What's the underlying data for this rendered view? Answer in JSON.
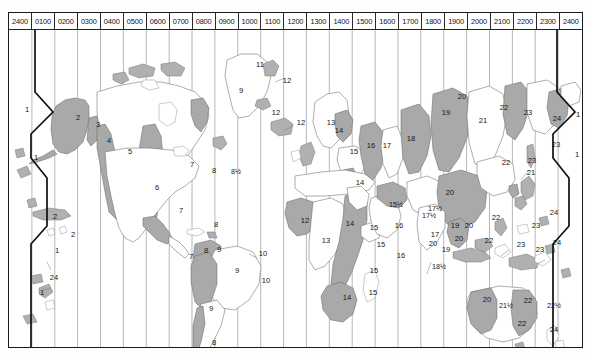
{
  "map": {
    "title": "World Standard Time Zone Chart",
    "hour_headers": [
      "2400",
      "0100",
      "0200",
      "0300",
      "0400",
      "0500",
      "0600",
      "0700",
      "0800",
      "0900",
      "1000",
      "1100",
      "1200",
      "1300",
      "1400",
      "1500",
      "1600",
      "1700",
      "1800",
      "1900",
      "2000",
      "2100",
      "2200",
      "2300",
      "2400"
    ],
    "colors": {
      "shaded_zone": "#a9a9a9",
      "unshaded_zone": "#ffffff",
      "coastline": "#6b6b6b",
      "meridian": "#9a9a9a",
      "dateline": "#101010",
      "frame": "#1a1a1a"
    },
    "zone_labels": [
      {
        "text": "1",
        "x": 18,
        "y": 97,
        "region": "bering-west"
      },
      {
        "text": "1",
        "x": 27,
        "y": 145,
        "region": "aleutians"
      },
      {
        "text": "2",
        "x": 69,
        "y": 105,
        "region": "alaska"
      },
      {
        "text": "3",
        "x": 89,
        "y": 112,
        "region": "yukon-coast"
      },
      {
        "text": "4",
        "x": 100,
        "y": 128,
        "region": "pacific-nw"
      },
      {
        "text": "5",
        "x": 121,
        "y": 139,
        "region": "canada-prairie"
      },
      {
        "text": "6",
        "x": 148,
        "y": 175,
        "region": "central-us-mexico"
      },
      {
        "text": "7",
        "x": 183,
        "y": 152,
        "region": "eastern-us"
      },
      {
        "text": "8",
        "x": 205,
        "y": 158,
        "region": "maritime-canada"
      },
      {
        "text": "8½",
        "x": 227,
        "y": 159,
        "region": "newfoundland"
      },
      {
        "text": "9",
        "x": 232,
        "y": 78,
        "region": "north-atlantic"
      },
      {
        "text": "11",
        "x": 251,
        "y": 52,
        "region": "greenland-west"
      },
      {
        "text": "12",
        "x": 278,
        "y": 68,
        "region": "greenland-east"
      },
      {
        "text": "12",
        "x": 267,
        "y": 100,
        "region": "iceland"
      },
      {
        "text": "12",
        "x": 292,
        "y": 110,
        "region": "faroe"
      },
      {
        "text": "13",
        "x": 322,
        "y": 110,
        "region": "scandinavia-west"
      },
      {
        "text": "14",
        "x": 330,
        "y": 118,
        "region": "finland"
      },
      {
        "text": "15",
        "x": 345,
        "y": 139,
        "region": "baltic"
      },
      {
        "text": "16",
        "x": 362,
        "y": 133,
        "region": "moscow"
      },
      {
        "text": "17",
        "x": 378,
        "y": 133,
        "region": "volga"
      },
      {
        "text": "18",
        "x": 402,
        "y": 126,
        "region": "urals"
      },
      {
        "text": "19",
        "x": 437,
        "y": 100,
        "region": "west-siberia"
      },
      {
        "text": "20",
        "x": 453,
        "y": 84,
        "region": "krasnoyarsk"
      },
      {
        "text": "21",
        "x": 474,
        "y": 108,
        "region": "irkutsk"
      },
      {
        "text": "22",
        "x": 495,
        "y": 95,
        "region": "yakutsk"
      },
      {
        "text": "23",
        "x": 519,
        "y": 100,
        "region": "magadan"
      },
      {
        "text": "24",
        "x": 548,
        "y": 106,
        "region": "kamchatka"
      },
      {
        "text": "1",
        "x": 569,
        "y": 102,
        "region": "dateline-east-top"
      },
      {
        "text": "1",
        "x": 568,
        "y": 142,
        "region": "dateline-east-low"
      },
      {
        "text": "22",
        "x": 497,
        "y": 150,
        "region": "amur"
      },
      {
        "text": "23",
        "x": 523,
        "y": 148,
        "region": "sakhalin"
      },
      {
        "text": "21",
        "x": 522,
        "y": 160,
        "region": "khabarovsk"
      },
      {
        "text": "23",
        "x": 547,
        "y": 132,
        "region": "kuril"
      },
      {
        "text": "20",
        "x": 441,
        "y": 180,
        "region": "china-north"
      },
      {
        "text": "12",
        "x": 296,
        "y": 208,
        "region": "west-africa"
      },
      {
        "text": "13",
        "x": 317,
        "y": 228,
        "region": "central-africa"
      },
      {
        "text": "14",
        "x": 341,
        "y": 211,
        "region": "east-africa"
      },
      {
        "text": "14",
        "x": 338,
        "y": 285,
        "region": "south-africa"
      },
      {
        "text": "14",
        "x": 351,
        "y": 170,
        "region": "egypt"
      },
      {
        "text": "15",
        "x": 365,
        "y": 215,
        "region": "horn"
      },
      {
        "text": "15",
        "x": 372,
        "y": 232,
        "region": "indian-ocean-w"
      },
      {
        "text": "15",
        "x": 365,
        "y": 258,
        "region": "madagascar-n"
      },
      {
        "text": "15",
        "x": 364,
        "y": 280,
        "region": "madagascar-s"
      },
      {
        "text": "15½",
        "x": 387,
        "y": 192,
        "region": "iran-w"
      },
      {
        "text": "16",
        "x": 390,
        "y": 213,
        "region": "arabia"
      },
      {
        "text": "16",
        "x": 392,
        "y": 243,
        "region": "seychelles"
      },
      {
        "text": "17",
        "x": 426,
        "y": 222,
        "region": "gulf"
      },
      {
        "text": "17½",
        "x": 420,
        "y": 203,
        "region": "india"
      },
      {
        "text": "17½",
        "x": 426,
        "y": 196,
        "region": "india-upper"
      },
      {
        "text": "19",
        "x": 446,
        "y": 213,
        "region": "indochina"
      },
      {
        "text": "19",
        "x": 437,
        "y": 237,
        "region": "sumatra"
      },
      {
        "text": "20",
        "x": 460,
        "y": 213,
        "region": "malaysia"
      },
      {
        "text": "20",
        "x": 450,
        "y": 226,
        "region": "borneo"
      },
      {
        "text": "20",
        "x": 424,
        "y": 231,
        "region": "bengal"
      },
      {
        "text": "18½",
        "x": 430,
        "y": 254,
        "region": "cocos"
      },
      {
        "text": "22",
        "x": 487,
        "y": 205,
        "region": "philippines"
      },
      {
        "text": "22",
        "x": 480,
        "y": 228,
        "region": "sulawesi"
      },
      {
        "text": "23",
        "x": 512,
        "y": 232,
        "region": "new-guinea"
      },
      {
        "text": "23",
        "x": 531,
        "y": 237,
        "region": "solomon"
      },
      {
        "text": "23",
        "x": 527,
        "y": 213,
        "region": "micronesia"
      },
      {
        "text": "24",
        "x": 545,
        "y": 200,
        "region": "marshall"
      },
      {
        "text": "24",
        "x": 548,
        "y": 230,
        "region": "fiji-n"
      },
      {
        "text": "20",
        "x": 478,
        "y": 287,
        "region": "west-australia"
      },
      {
        "text": "21½",
        "x": 497,
        "y": 293,
        "region": "central-australia"
      },
      {
        "text": "22",
        "x": 519,
        "y": 288,
        "region": "east-australia"
      },
      {
        "text": "22½",
        "x": 545,
        "y": 293,
        "region": "norfolk"
      },
      {
        "text": "22",
        "x": 513,
        "y": 311,
        "region": "tasmania"
      },
      {
        "text": "24",
        "x": 545,
        "y": 317,
        "region": "new-zealand"
      },
      {
        "text": "7",
        "x": 172,
        "y": 198,
        "region": "panama"
      },
      {
        "text": "7",
        "x": 182,
        "y": 244,
        "region": "colombia"
      },
      {
        "text": "8",
        "x": 207,
        "y": 212,
        "region": "venezuela-n"
      },
      {
        "text": "8",
        "x": 197,
        "y": 238,
        "region": "bolivia"
      },
      {
        "text": "9",
        "x": 210,
        "y": 237,
        "region": "guyana"
      },
      {
        "text": "9",
        "x": 228,
        "y": 258,
        "region": "brazil"
      },
      {
        "text": "9",
        "x": 202,
        "y": 296,
        "region": "argentina"
      },
      {
        "text": "10",
        "x": 254,
        "y": 241,
        "region": "brazil-east"
      },
      {
        "text": "10",
        "x": 257,
        "y": 268,
        "region": "atlantic-isle"
      },
      {
        "text": "8",
        "x": 205,
        "y": 330,
        "region": "falkland"
      },
      {
        "text": "10",
        "x": 253,
        "y": 339,
        "region": "south-atlantic"
      },
      {
        "text": "2",
        "x": 46,
        "y": 204,
        "region": "hawaii"
      },
      {
        "text": "2",
        "x": 64,
        "y": 222,
        "region": "pacific-isle"
      },
      {
        "text": "1",
        "x": 48,
        "y": 238,
        "region": "samoa"
      },
      {
        "text": "24",
        "x": 45,
        "y": 265,
        "region": "tonga"
      },
      {
        "text": "1",
        "x": 33,
        "y": 280,
        "region": "pacific-sw"
      }
    ]
  }
}
